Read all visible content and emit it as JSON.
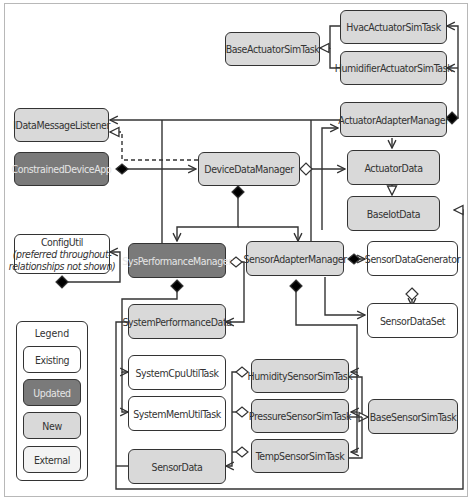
{
  "diagram": {
    "type": "UML class diagram",
    "colors": {
      "existing": "#ffffff",
      "updated": "#7a7a7a",
      "new": "#d9d9d9",
      "external": "#f3f3f3",
      "line": "#333333"
    },
    "classes": {
      "hvac_actuator_sim_task": "HvacActuatorSimTask",
      "base_actuator_sim_task": "BaseActuatorSimTask",
      "humidifier_actuator_sim_task": "HumidifierActuatorSimTask",
      "idata_message_listener": "IDataMessageListener",
      "actuator_adapter_manager": "ActuatorAdapterManager",
      "constrained_device_app": "ConstrainedDeviceApp",
      "device_data_manager": "DeviceDataManager",
      "actuator_data": "ActuatorData",
      "base_iot_data": "BaseIotData",
      "config_util": "ConfigUtil",
      "config_util_note": "(preferred throughout-",
      "config_util_note2": "relationships not shown)",
      "sys_performance_manager": "SysPerformanceManager",
      "sensor_adapter_manager": "SensorAdapterManager",
      "sensor_data_generator": "SensorDataGenerator",
      "sensor_data_set": "SensorDataSet",
      "system_performance_data": "SystemPerformanceData",
      "system_cpu_util_task": "SystemCpuUtilTask",
      "system_mem_util_task": "SystemMemUtilTask",
      "humidity_sensor_sim_task": "HumiditySensorSimTask",
      "pressure_sensor_sim_task": "PressureSensorSimTask",
      "base_sensor_sim_task": "BaseSensorSimTask",
      "temp_sensor_sim_task": "TempSensorSimTask",
      "sensor_data": "SensorData"
    },
    "legend": {
      "title": "Legend",
      "existing": "Existing",
      "updated": "Updated",
      "new": "New",
      "external": "External"
    }
  }
}
